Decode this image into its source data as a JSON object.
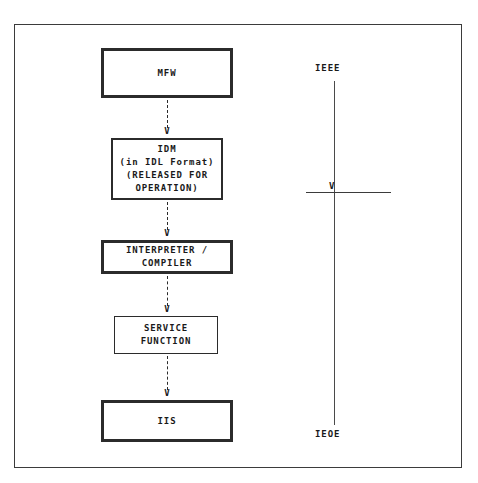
{
  "diagram": {
    "frame": {
      "border_color": "#3b3b3b"
    },
    "nodes": [
      {
        "id": "mfw",
        "label": "MFW",
        "border": "thick"
      },
      {
        "id": "idm",
        "label": "IDM\n(in IDL Format)\n(RELEASED FOR\nOPERATION)",
        "border": "medium"
      },
      {
        "id": "interpreter",
        "label": "INTERPRETER /\nCOMPILER",
        "border": "thick"
      },
      {
        "id": "service",
        "label": "SERVICE\nFUNCTION",
        "border": "thin"
      },
      {
        "id": "iis",
        "label": "IIS",
        "border": "thick"
      }
    ],
    "arrows": [
      {
        "id": "mfw-idm",
        "from": "mfw",
        "to": "idm",
        "head": "V",
        "style": "dashed"
      },
      {
        "id": "idm-interp",
        "from": "idm",
        "to": "interpreter",
        "head": "V",
        "style": "dashed"
      },
      {
        "id": "interp-service",
        "from": "interpreter",
        "to": "service",
        "head": "V",
        "style": "dashed"
      },
      {
        "id": "service-iis",
        "from": "service",
        "to": "iis",
        "head": "V",
        "style": "dashed"
      }
    ],
    "timeline": {
      "top_label": "IEEE",
      "bottom_label": "IEOE",
      "marker_head": "V",
      "line_color": "#4a4a4a"
    }
  }
}
